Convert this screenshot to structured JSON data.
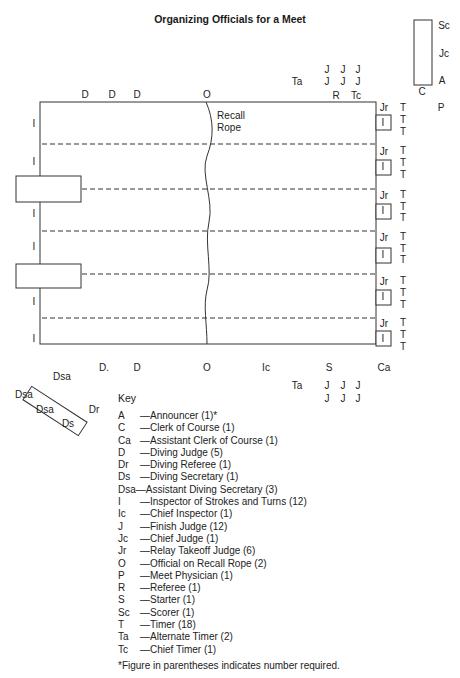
{
  "title": "Organizing Officials for a Meet",
  "pool": {
    "recall_rope_label_1": "Recall",
    "recall_rope_label_2": "Rope",
    "top_edge": {
      "D1": "D",
      "D2": "D",
      "D3": "D",
      "O": "O"
    },
    "bottom_edge": {
      "D1": "D.",
      "D2": "D",
      "O": "O",
      "Ic": "Ic",
      "S": "S",
      "Ca": "Ca"
    },
    "left_inspectors": [
      "I",
      "I",
      "I",
      "I",
      "I",
      "I"
    ],
    "lanes": [
      {
        "jr": "Jr",
        "i": "I",
        "timers": [
          "T",
          "T",
          "T"
        ]
      },
      {
        "jr": "Jr",
        "i": "I",
        "timers": [
          "T",
          "T",
          "T"
        ]
      },
      {
        "jr": "Jr",
        "i": "I",
        "timers": [
          "T",
          "T",
          "T"
        ]
      },
      {
        "jr": "Jr",
        "i": "I",
        "timers": [
          "T",
          "T",
          "T"
        ]
      },
      {
        "jr": "Jr",
        "i": "I",
        "timers": [
          "T",
          "T",
          "T"
        ]
      },
      {
        "jr": "Jr",
        "i": "I",
        "timers": [
          "T",
          "T",
          "T"
        ]
      }
    ]
  },
  "top_right": {
    "judges_row1": [
      "J",
      "J",
      "J"
    ],
    "judges_row2": [
      "J",
      "J",
      "J"
    ],
    "ta": "Ta",
    "r": "R",
    "tc": "Tc",
    "table_labels": {
      "sc": "Sc",
      "jc": "Jc",
      "a": "A",
      "c": "C",
      "p": "P"
    }
  },
  "bottom_right": {
    "ta": "Ta",
    "judges_row1": [
      "J",
      "J",
      "J"
    ],
    "judges_row2": [
      "J",
      "J",
      "J"
    ]
  },
  "diving_table": {
    "dsa_top": "Dsa",
    "dsa_left": "Dsa",
    "dsa_mid": "Dsa",
    "ds": "Ds",
    "dr": "Dr"
  },
  "key": {
    "heading": "Key",
    "entries": [
      {
        "abbr": "A",
        "desc": "—Announcer (1)*"
      },
      {
        "abbr": "C",
        "desc": "—Clerk of Course (1)"
      },
      {
        "abbr": "Ca",
        "desc": "—Assistant Clerk of Course (1)"
      },
      {
        "abbr": "D",
        "desc": "—Diving Judge (5)"
      },
      {
        "abbr": "Dr",
        "desc": "—Diving Referee (1)"
      },
      {
        "abbr": "Ds",
        "desc": "—Diving Secretary (1)"
      },
      {
        "abbr": "Dsa",
        "desc": "—Assistant Diving Secretary (3)"
      },
      {
        "abbr": "I",
        "desc": "—Inspector of Strokes and Turns (12)"
      },
      {
        "abbr": "Ic",
        "desc": "—Chief Inspector (1)"
      },
      {
        "abbr": "J",
        "desc": "—Finish Judge (12)"
      },
      {
        "abbr": "Jc",
        "desc": "—Chief Judge (1)"
      },
      {
        "abbr": "Jr",
        "desc": "—Relay Takeoff Judge (6)"
      },
      {
        "abbr": "O",
        "desc": "—Official on Recall Rope (2)"
      },
      {
        "abbr": "P",
        "desc": "—Meet Physician (1)"
      },
      {
        "abbr": "R",
        "desc": "—Referee (1)"
      },
      {
        "abbr": "S",
        "desc": "—Starter (1)"
      },
      {
        "abbr": "Sc",
        "desc": "—Scorer (1)"
      },
      {
        "abbr": "T",
        "desc": "—Timer (18)"
      },
      {
        "abbr": "Ta",
        "desc": "—Alternate Timer (2)"
      },
      {
        "abbr": "Tc",
        "desc": "—Chief Timer (1)"
      }
    ],
    "footnote": "*Figure in parentheses indicates number required."
  }
}
